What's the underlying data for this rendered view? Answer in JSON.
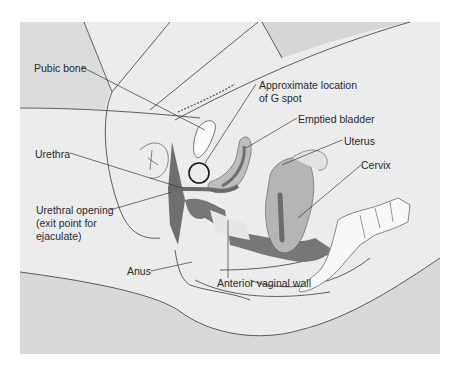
{
  "figure": {
    "colors": {
      "background": "#ececec",
      "skin_shade": "#d9d9d9",
      "light_tissue": "#f4f4f4",
      "organ_mid": "#b8b8b8",
      "organ_dark": "#7a7a7a",
      "outline": "#3a3a3a"
    }
  },
  "labels": {
    "pubic_bone": "Pubic bone",
    "g_spot_line1": "Approximate location",
    "g_spot_line2": "of G spot",
    "emptied_bladder": "Emptied bladder",
    "uterus": "Uterus",
    "cervix": "Cervix",
    "urethra": "Urethra",
    "urethral_opening_line1": "Urethral opening",
    "urethral_opening_line2": "(exit point for",
    "urethral_opening_line3": "ejaculate)",
    "anus": "Anus",
    "anterior_vaginal_wall": "Anterior vaginal wall"
  }
}
